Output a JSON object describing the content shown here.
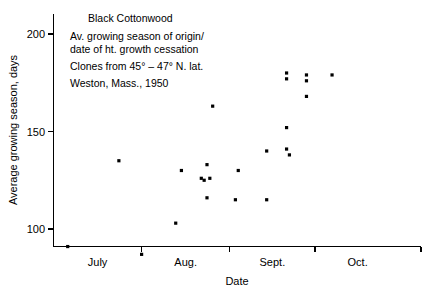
{
  "chart_data": {
    "type": "scatter",
    "title": "Black Cottonwood",
    "xlabel": "Date",
    "ylabel": "Average growing season, days",
    "grid": false,
    "legend": "none",
    "annotations": [
      "Black Cottonwood",
      "Av. growing season of origin/",
      "date of ht. growth cessation",
      "Clones from 45° – 47° N. lat.",
      "Weston, Mass., 1950"
    ],
    "xaxis": {
      "tick_labels": [
        "July",
        "Aug.",
        "Sept.",
        "Oct."
      ],
      "tick_positions_days": [
        0,
        31,
        62,
        92
      ],
      "xlim_days": [
        0,
        110
      ],
      "label_offsets_days": [
        15.5,
        46.5,
        77,
        107
      ]
    },
    "yaxis": {
      "tick_labels": [
        "100",
        "150",
        "200"
      ],
      "tick_values": [
        100,
        150,
        200
      ],
      "ylim": [
        78,
        207
      ]
    },
    "points": [
      {
        "x_days": 5,
        "y": 91,
        "date": "July 6"
      },
      {
        "x_days": 23,
        "y": 135,
        "date": "July 24"
      },
      {
        "x_days": 31,
        "y": 87,
        "date": "Aug. 1"
      },
      {
        "x_days": 43,
        "y": 103,
        "date": "Aug. 13"
      },
      {
        "x_days": 45,
        "y": 130,
        "date": "Aug. 15"
      },
      {
        "x_days": 52,
        "y": 126,
        "date": "Aug. 22"
      },
      {
        "x_days": 53,
        "y": 125,
        "date": "Aug. 23"
      },
      {
        "x_days": 54,
        "y": 133,
        "date": "Aug. 24"
      },
      {
        "x_days": 54,
        "y": 116,
        "date": "Aug. 24"
      },
      {
        "x_days": 55,
        "y": 126,
        "date": "Aug. 25"
      },
      {
        "x_days": 56,
        "y": 163,
        "date": "Aug. 26"
      },
      {
        "x_days": 64,
        "y": 115,
        "date": "Sept. 2"
      },
      {
        "x_days": 65,
        "y": 130,
        "date": "Sept. 3"
      },
      {
        "x_days": 75,
        "y": 115,
        "date": "Sept. 13"
      },
      {
        "x_days": 75,
        "y": 140,
        "date": "Sept. 13"
      },
      {
        "x_days": 82,
        "y": 180,
        "date": "Sept. 20"
      },
      {
        "x_days": 82,
        "y": 177,
        "date": "Sept. 20"
      },
      {
        "x_days": 82,
        "y": 152,
        "date": "Sept. 20"
      },
      {
        "x_days": 82,
        "y": 141,
        "date": "Sept. 20"
      },
      {
        "x_days": 83,
        "y": 138,
        "date": "Sept. 21"
      },
      {
        "x_days": 89,
        "y": 179,
        "date": "Sept. 27"
      },
      {
        "x_days": 89,
        "y": 176,
        "date": "Sept. 27"
      },
      {
        "x_days": 89,
        "y": 168,
        "date": "Sept. 27"
      },
      {
        "x_days": 98,
        "y": 179,
        "date": "Oct. 6"
      }
    ]
  }
}
